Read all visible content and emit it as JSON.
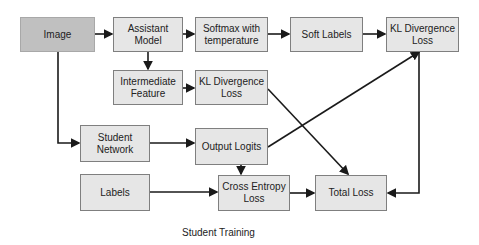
{
  "diagram": {
    "nodes": {
      "image": "Image",
      "assistant_model": "Assistant Model",
      "softmax": "Softmax with temperature",
      "soft_labels": "Soft Labels",
      "kl_top": "KL Divergence Loss",
      "intermediate": "Intermediate Feature",
      "kl_mid": "KL Divergence Loss",
      "student_network": "Student Network",
      "output_logits": "Output Logits",
      "labels": "Labels",
      "cross_entropy": "Cross Entropy Loss",
      "total_loss": "Total Loss"
    },
    "edges": [
      [
        "Image",
        "Assistant Model"
      ],
      [
        "Assistant Model",
        "Softmax with temperature"
      ],
      [
        "Softmax with temperature",
        "Soft Labels"
      ],
      [
        "Soft Labels",
        "KL Divergence Loss (top)"
      ],
      [
        "Assistant Model",
        "Intermediate Feature"
      ],
      [
        "Intermediate Feature",
        "KL Divergence Loss (middle)"
      ],
      [
        "Image",
        "Student Network"
      ],
      [
        "Student Network",
        "Output Logits"
      ],
      [
        "Output Logits",
        "KL Divergence Loss (top)"
      ],
      [
        "Output Logits",
        "Cross Entropy Loss"
      ],
      [
        "Labels",
        "Cross Entropy Loss"
      ],
      [
        "Cross Entropy Loss",
        "Total Loss"
      ],
      [
        "KL Divergence Loss (middle)",
        "Total Loss"
      ],
      [
        "KL Divergence Loss (top)",
        "Total Loss"
      ]
    ],
    "caption": "Student Training",
    "colors": {
      "input_fill": "#c0c0c0",
      "node_fill": "#e6e6e6",
      "border": "#7f7f7f",
      "line": "#1a1a1a"
    }
  }
}
